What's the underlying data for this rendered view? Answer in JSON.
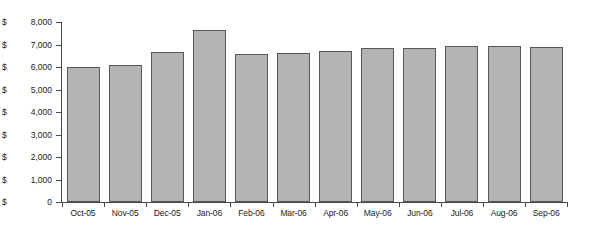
{
  "chart_data": {
    "type": "bar",
    "title": "",
    "subtitle": "",
    "xlabel": "",
    "ylabel": "",
    "categories": [
      "Oct-05",
      "Nov-05",
      "Dec-05",
      "Jan-06",
      "Feb-06",
      "Mar-06",
      "Apr-06",
      "May-06",
      "Jun-06",
      "Jul-06",
      "Aug-06",
      "Sep-06"
    ],
    "values": [
      6000,
      6100,
      6650,
      7650,
      6600,
      6620,
      6700,
      6850,
      6830,
      6950,
      6930,
      6900
    ],
    "ylim": [
      0,
      8000
    ],
    "ytick_values": [
      0,
      1000,
      2000,
      3000,
      4000,
      5000,
      6000,
      7000,
      8000
    ],
    "ytick_labels": [
      "$          0",
      "$1,000",
      "$2,000",
      "$3,000",
      "$4,000",
      "$5,000",
      "$6,000",
      "$7,000",
      "$8,000"
    ],
    "grid": false,
    "legend": null,
    "legend_position": "none",
    "series": [
      {
        "name": "",
        "values": [
          6000,
          6100,
          6650,
          7650,
          6600,
          6620,
          6700,
          6850,
          6830,
          6950,
          6930,
          6900
        ]
      }
    ],
    "bar_fill_color": "#b4b4b4",
    "bar_border_color": "#585858",
    "axis_color": "#4a4a4a",
    "background_color": "#ffffff"
  },
  "axis": {
    "y_labels": [
      {
        "dollar": "$",
        "num": "8,000"
      },
      {
        "dollar": "$",
        "num": "7,000"
      },
      {
        "dollar": "$",
        "num": "6,000"
      },
      {
        "dollar": "$",
        "num": "5,000"
      },
      {
        "dollar": "$",
        "num": "4,000"
      },
      {
        "dollar": "$",
        "num": "3,000"
      },
      {
        "dollar": "$",
        "num": "2,000"
      },
      {
        "dollar": "$",
        "num": "1,000"
      },
      {
        "dollar": "$",
        "num": "0"
      }
    ]
  }
}
